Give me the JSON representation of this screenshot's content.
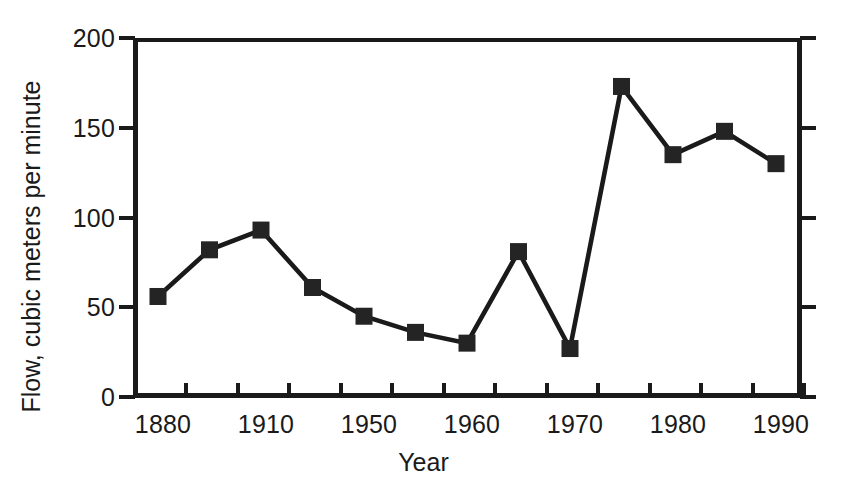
{
  "chart_data": {
    "type": "line",
    "title": "",
    "xlabel": "Year",
    "ylabel": "Flow, cubic meters per minute",
    "ylim": [
      0,
      200
    ],
    "ytick_values": [
      0,
      50,
      100,
      150,
      200
    ],
    "ytick_labels": [
      "0",
      "50",
      "100",
      "150",
      "200"
    ],
    "grid": false,
    "legend": "none",
    "x_axis_kind": "categorical",
    "x": [
      1880,
      1895,
      1910,
      1940,
      1950,
      1955,
      1960,
      1965,
      1970,
      1976,
      1980,
      1986,
      1991
    ],
    "xtick_labels": [
      "1880",
      "1910",
      "1950",
      "1960",
      "1970",
      "1980",
      "1990"
    ],
    "xtick_label_indices": [
      0,
      2,
      4,
      6,
      8,
      10,
      12
    ],
    "values": [
      56,
      82,
      93,
      61,
      45,
      36,
      30,
      81,
      27,
      173,
      135,
      148,
      130
    ],
    "series": [
      {
        "name": "Flow",
        "marker": "filled-square",
        "color": "#1a1a1a",
        "values": [
          56,
          82,
          93,
          61,
          45,
          36,
          30,
          81,
          27,
          173,
          135,
          148,
          130
        ]
      }
    ]
  },
  "colors": {
    "line": "#1a1a1a",
    "marker": "#242424",
    "axis": "#1a1a1a",
    "background": "#ffffff",
    "text": "#1a1a1a"
  }
}
